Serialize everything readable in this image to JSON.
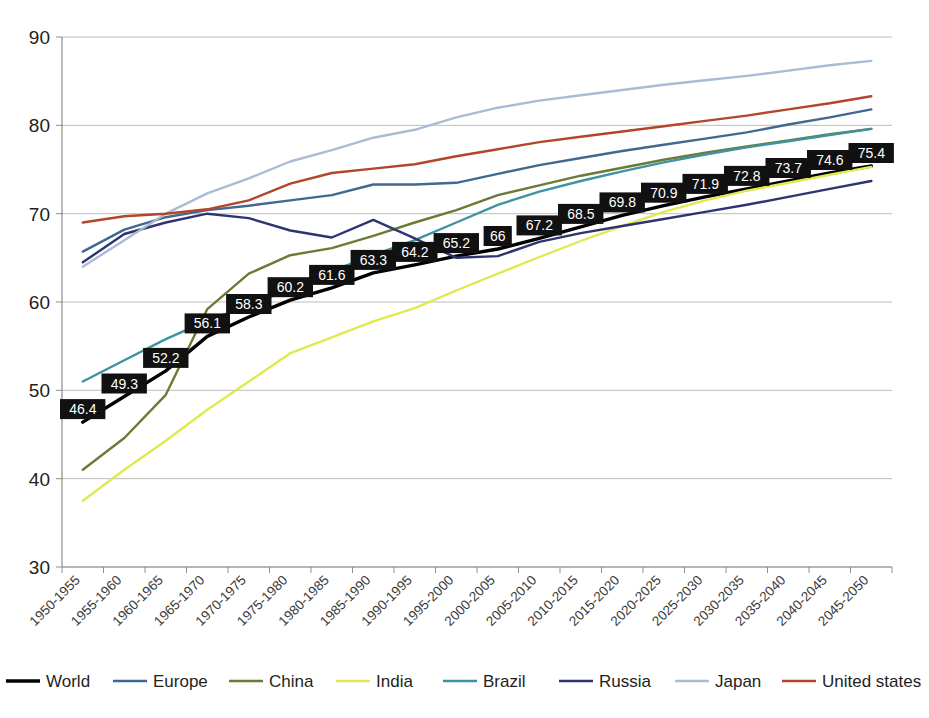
{
  "chart_data": {
    "type": "line",
    "title": "",
    "subtitle": "",
    "xlabel": "",
    "ylabel": "",
    "ylim": [
      30,
      90
    ],
    "yticks": [
      30,
      40,
      50,
      60,
      70,
      80,
      90
    ],
    "grid": true,
    "legend_position": "bottom",
    "categories": [
      "1950-1955",
      "1955-1960",
      "1960-1965",
      "1965-1970",
      "1970-1975",
      "1975-1980",
      "1980-1985",
      "1985-1990",
      "1990-1995",
      "1995-2000",
      "2000-2005",
      "2005-2010",
      "2010-2015",
      "2015-2020",
      "2020-2025",
      "2025-2030",
      "2030-2035",
      "2035-2040",
      "2040-2045",
      "2045-2050"
    ],
    "series": [
      {
        "name": "World",
        "color": "#000000",
        "width": 3.4,
        "labeled": true,
        "values": [
          46.4,
          49.3,
          52.2,
          56.1,
          58.3,
          60.2,
          61.6,
          63.3,
          64.2,
          65.2,
          66,
          67.2,
          68.5,
          69.8,
          70.9,
          71.9,
          72.8,
          73.7,
          74.6,
          75.4
        ]
      },
      {
        "name": "Europe",
        "color": "#41688f",
        "width": 2.4,
        "labeled": false,
        "values": [
          65.7,
          68.2,
          69.6,
          70.4,
          70.9,
          71.5,
          72.1,
          73.3,
          73.3,
          73.5,
          74.5,
          75.5,
          76.3,
          77.1,
          77.8,
          78.5,
          79.2,
          80.1,
          80.9,
          81.8
        ]
      },
      {
        "name": "China",
        "color": "#6b7a35",
        "width": 2.4,
        "labeled": false,
        "values": [
          41.0,
          44.6,
          49.5,
          59.2,
          63.2,
          65.3,
          66.1,
          67.5,
          69.0,
          70.4,
          72.1,
          73.2,
          74.3,
          75.2,
          76.1,
          76.9,
          77.6,
          78.3,
          79.0,
          79.6
        ]
      },
      {
        "name": "India",
        "color": "#e0ea4f",
        "width": 2.4,
        "labeled": false,
        "values": [
          37.5,
          41.0,
          44.3,
          47.8,
          51.0,
          54.2,
          56.0,
          57.8,
          59.3,
          61.3,
          63.2,
          65.1,
          66.9,
          68.6,
          70.2,
          71.5,
          72.6,
          73.5,
          74.4,
          75.3
        ]
      },
      {
        "name": "Brazil",
        "color": "#3e93a3",
        "width": 2.4,
        "labeled": false,
        "values": [
          51.0,
          53.4,
          55.8,
          57.9,
          59.6,
          61.5,
          63.5,
          65.3,
          67.0,
          69.0,
          71.0,
          72.5,
          73.7,
          74.8,
          75.8,
          76.7,
          77.5,
          78.2,
          78.9,
          79.6
        ]
      },
      {
        "name": "Russia",
        "color": "#2f3470",
        "width": 2.4,
        "labeled": false,
        "values": [
          64.5,
          67.7,
          69.0,
          70.0,
          69.5,
          68.1,
          67.3,
          69.3,
          67.2,
          65.0,
          65.2,
          66.8,
          67.8,
          68.6,
          69.4,
          70.2,
          71.0,
          71.9,
          72.8,
          73.7
        ]
      },
      {
        "name": "Japan",
        "color": "#a8bcd6",
        "width": 2.4,
        "labeled": false,
        "values": [
          64.0,
          67.0,
          70.0,
          72.3,
          74.0,
          75.9,
          77.2,
          78.6,
          79.5,
          80.9,
          82.0,
          82.8,
          83.4,
          84.0,
          84.6,
          85.1,
          85.6,
          86.2,
          86.8,
          87.3
        ]
      },
      {
        "name": "United states",
        "color": "#b2452a",
        "width": 2.4,
        "labeled": false,
        "values": [
          69.0,
          69.7,
          70.0,
          70.5,
          71.5,
          73.4,
          74.6,
          75.1,
          75.6,
          76.5,
          77.3,
          78.1,
          78.7,
          79.3,
          79.9,
          80.5,
          81.1,
          81.8,
          82.5,
          83.3
        ]
      }
    ]
  },
  "legend": {
    "items": [
      {
        "label": "World",
        "color": "#000000"
      },
      {
        "label": "Europe",
        "color": "#41688f"
      },
      {
        "label": "China",
        "color": "#6b7a35"
      },
      {
        "label": "India",
        "color": "#e0ea4f"
      },
      {
        "label": "Brazil",
        "color": "#3e93a3"
      },
      {
        "label": "Russia",
        "color": "#2f3470"
      },
      {
        "label": "Japan",
        "color": "#a8bcd6"
      },
      {
        "label": "United states",
        "color": "#b2452a"
      }
    ]
  }
}
